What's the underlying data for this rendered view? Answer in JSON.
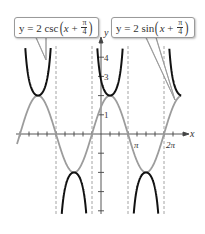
{
  "chart_data": {
    "type": "line",
    "title": "",
    "xlabel": "x",
    "ylabel": "y",
    "x_tick_labels": [
      "π",
      "2π"
    ],
    "y_tick_labels": [
      "1",
      "3",
      "4"
    ],
    "x_tick_spacing": "π/4",
    "xlim": [
      -7.33,
      7.0
    ],
    "ylim": [
      -4.5,
      4.8
    ],
    "grid": false,
    "asymptotes_x": [
      "-5π/4",
      "-π/4",
      "3π/4",
      "7π/4"
    ],
    "series": [
      {
        "name": "y = 2 csc(x + π/4)",
        "color": "#111111",
        "style": "solid-thick",
        "description": "Cosecant branches, local min at y=2 at x=-7π/4 and x=π/4, local max at y=-2 at x=-3π/4 and x=5π/4, partial branch near 2π",
        "key_points": [
          [
            -5.498,
            2
          ],
          [
            -2.356,
            -2
          ],
          [
            0.785,
            2
          ],
          [
            3.927,
            -2
          ],
          [
            7.069,
            2
          ]
        ]
      },
      {
        "name": "y = 2 sin(x + π/4)",
        "color": "#999999",
        "style": "solid",
        "description": "Sine wave amplitude 2, period 2π, phase shift -π/4",
        "key_points": [
          [
            -5.498,
            2
          ],
          [
            -3.927,
            0
          ],
          [
            -2.356,
            -2
          ],
          [
            -0.785,
            0
          ],
          [
            0.785,
            2
          ],
          [
            2.356,
            0
          ],
          [
            3.927,
            -2
          ],
          [
            5.498,
            0
          ],
          [
            7.069,
            2
          ]
        ]
      }
    ],
    "annotations": [
      {
        "text": "y = 2 csc(x + π/4)",
        "points_to": "cosecant curve (left branch)"
      },
      {
        "text": "y = 2 sin(x + π/4)",
        "points_to": "sine curve (right end)"
      }
    ]
  },
  "labels": {
    "x_axis": "x",
    "y_axis": "y",
    "pi": "π",
    "two_pi": "2π",
    "y1": "1",
    "y3": "3",
    "y4": "4"
  },
  "callout_csc": {
    "prefix": "y = 2 csc",
    "x": "x",
    "plus": " + ",
    "num": "π",
    "den": "4"
  },
  "callout_sin": {
    "prefix": "y = 2 sin",
    "x": "x",
    "plus": " + ",
    "num": "π",
    "den": "4"
  }
}
